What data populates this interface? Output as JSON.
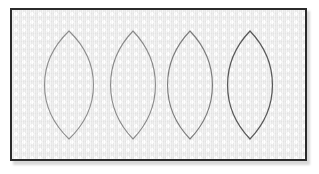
{
  "figure": {
    "type": "line-drawing",
    "shape_count": 4
  },
  "frame": {
    "name": "panel-frame",
    "x": 10,
    "y": 8,
    "width": 297,
    "height": 153,
    "border_color": "#2b2b2b",
    "border_width": 2,
    "background_color": "#f1f1f1",
    "shadow_color": "#b9b9b9"
  },
  "canvas": {
    "width": 319,
    "height": 174,
    "background_color": "#ffffff"
  },
  "shapes": [
    {
      "id": "lens-1",
      "label": "Lens 1",
      "center_x": 69,
      "top_y": 31,
      "bottom_y": 139,
      "half_width": 24,
      "stroke_color": "#8e8e8e",
      "stroke_width": 1.1
    },
    {
      "id": "lens-2",
      "label": "Lens 2",
      "center_x": 133,
      "top_y": 31,
      "bottom_y": 139,
      "half_width": 22,
      "stroke_color": "#8a8a8a",
      "stroke_width": 1.1
    },
    {
      "id": "lens-3",
      "label": "Lens 3",
      "center_x": 190,
      "top_y": 31,
      "bottom_y": 139,
      "half_width": 22,
      "stroke_color": "#7d7d7d",
      "stroke_width": 1.15
    },
    {
      "id": "lens-4",
      "label": "Lens 4",
      "center_x": 250,
      "top_y": 31,
      "bottom_y": 139,
      "half_width": 22,
      "stroke_color": "#595959",
      "stroke_width": 1.25
    }
  ]
}
